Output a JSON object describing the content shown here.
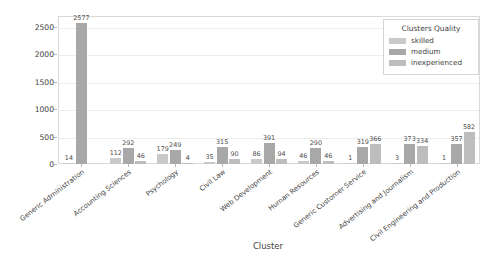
{
  "chart_data": {
    "type": "bar",
    "title": "",
    "xlabel": "Cluster",
    "ylabel": "Quantity of CVs",
    "ylim": [
      0,
      2700
    ],
    "yticks": [
      0,
      500,
      1000,
      1500,
      2000,
      2500
    ],
    "grid": true,
    "legend_position": "upper right",
    "legend_title": "Clusters Quality",
    "categories": [
      "Generic Administration",
      "Accounting Sciences",
      "Psychology",
      "Civil Law",
      "Web Development",
      "Human Resources",
      "Generic Customer Service",
      "Advertising and Journalism",
      "Civil Engineering and Production"
    ],
    "series": [
      {
        "name": "skilled",
        "color": "#c9c9c9",
        "values": [
          14,
          112,
          179,
          35,
          86,
          46,
          1,
          3,
          1
        ]
      },
      {
        "name": "medium",
        "color": "#a8a8a8",
        "values": [
          2577,
          292,
          249,
          315,
          391,
          290,
          319,
          373,
          357
        ]
      },
      {
        "name": "inexperienced",
        "color": "#bdbdbd",
        "values": [
          0,
          46,
          4,
          90,
          94,
          46,
          366,
          334,
          582
        ]
      }
    ]
  },
  "colors": {
    "axis_text": "#3f3f3f",
    "grid": "#ececec",
    "plot_border": "#d9d9d9",
    "background": "#ffffff"
  }
}
